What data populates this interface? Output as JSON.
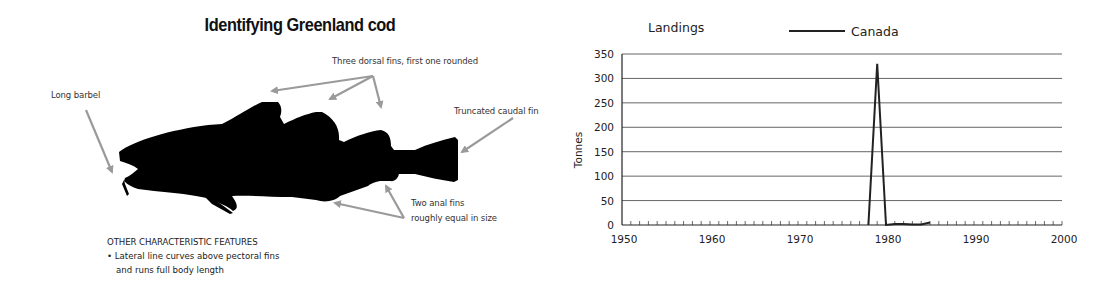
{
  "illustration": {
    "title": "Identifying Greenland cod",
    "labels": {
      "barbel": "Long barbel",
      "dorsal": "Three dorsal fins, first one rounded",
      "caudal": "Truncated caudal fin",
      "anal_line1": "Two anal fins",
      "anal_line2": "roughly equal in size"
    },
    "features": {
      "heading": "OTHER CHARACTERISTIC FEATURES",
      "bullet_line1": "• Lateral line curves above pectoral fins",
      "bullet_line2": "and runs full body length"
    },
    "colors": {
      "silhouette": "#000000",
      "arrow": "#999999"
    }
  },
  "chart": {
    "title": "Landings",
    "legend_label": "Canada",
    "ylabel": "Tonnes",
    "y_ticks": [
      "0",
      "50",
      "100",
      "150",
      "200",
      "250",
      "300",
      "350"
    ],
    "x_ticks": [
      "1950",
      "1960",
      "1970",
      "1980",
      "1990",
      "2000"
    ]
  },
  "chart_data": {
    "type": "line",
    "title": "Landings",
    "xlabel": "",
    "ylabel": "Tonnes",
    "xlim": [
      1950,
      2000
    ],
    "ylim": [
      0,
      350
    ],
    "x_ticks": [
      1950,
      1960,
      1970,
      1980,
      1990,
      2000
    ],
    "y_ticks": [
      0,
      50,
      100,
      150,
      200,
      250,
      300,
      350
    ],
    "grid": "horizontal",
    "legend_position": "top",
    "series": [
      {
        "name": "Canada",
        "color": "#222222",
        "x": [
          1978,
          1979,
          1980,
          1981,
          1982,
          1983,
          1984,
          1985
        ],
        "values": [
          0,
          330,
          0,
          2,
          2,
          1,
          1,
          5
        ]
      }
    ]
  }
}
